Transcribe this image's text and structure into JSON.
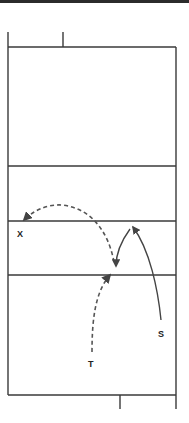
{
  "diagram": {
    "title": "",
    "colors": {
      "lines": "#3a3a3a",
      "movement": "#444444",
      "top_bar": "#2b2b2b"
    },
    "players": [
      {
        "id": "X",
        "label": "X",
        "x": 21,
        "y": 236
      },
      {
        "id": "S",
        "label": "S",
        "x": 162,
        "y": 336
      },
      {
        "id": "T",
        "label": "T",
        "x": 92,
        "y": 366
      }
    ],
    "court": {
      "outer": {
        "left": 8,
        "top": 47,
        "right": 176,
        "bottom": 395
      },
      "horizontal_lines_y": [
        166,
        221,
        275
      ],
      "top_post_x": 63,
      "bottom_post_x": 120
    },
    "movements": [
      {
        "from": "T",
        "to": "center",
        "style": "dashed"
      },
      {
        "from": "center",
        "to": "X",
        "style": "dashed"
      },
      {
        "from": "S",
        "to": "net-right",
        "style": "solid"
      },
      {
        "from": "net-right",
        "to": "center",
        "style": "solid"
      }
    ]
  }
}
